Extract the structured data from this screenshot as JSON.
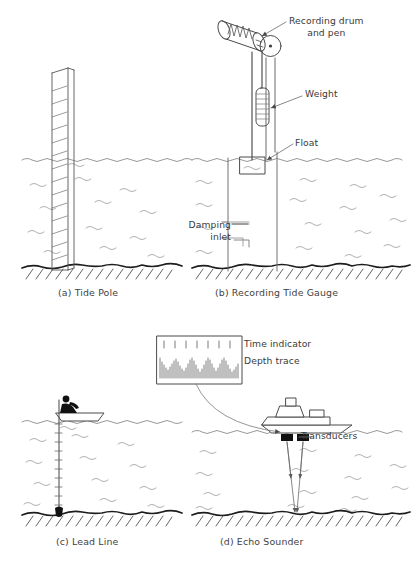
{
  "figure": {
    "background_color": "#ffffff",
    "ink_color": "#4a4a4a",
    "text_color": "#3a3a3a",
    "water_line_color": "#8a8a8a",
    "seabed_color": "#1a1a1a"
  },
  "panels": [
    {
      "id": "a",
      "caption": "(a) Tide Pole"
    },
    {
      "id": "b",
      "caption": "(b) Recording Tide Gauge"
    },
    {
      "id": "c",
      "caption": "(c) Lead Line"
    },
    {
      "id": "d",
      "caption": "(d) Echo Sounder"
    }
  ],
  "callouts": {
    "recording_drum_line1": "Recording drum",
    "recording_drum_line2": "and pen",
    "weight": "Weight",
    "float": "Float",
    "damping_line1": "Damping",
    "damping_line2": "inlet",
    "time_indicator": "Time indicator",
    "depth_trace": "Depth trace",
    "transducers": "Transducers"
  },
  "elements": {
    "tide_pole": "graduated staff",
    "stilling_well": "vertical tube",
    "pulley": "pulley-wheel",
    "drum": "recording-drum-cylinder",
    "pen_trace": "zigzag-pen-trace",
    "counterweight": "ribbed-cylinder-weight",
    "float_box": "float-rectangle",
    "lead_weight": "lead-sinker",
    "leadsman": "person-silhouette",
    "dinghy": "small-boat",
    "survey_ship": "ship-profile",
    "transducer_left": "transducer-block",
    "transducer_right": "transducer-block",
    "echo_beams": "sound-beam-rays",
    "chart_recorder": "echo-sounder-chart"
  },
  "footer": {
    "cut_off_caption": ""
  }
}
